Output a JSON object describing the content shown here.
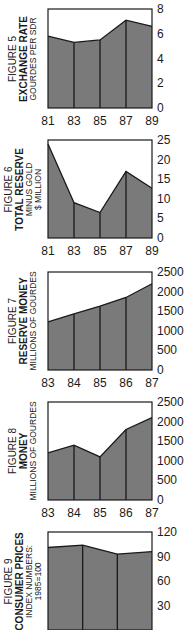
{
  "chart_data": [
    {
      "type": "area",
      "figure": "FIGURE 5",
      "title": "EXCHANGE RATE",
      "ylabel": "GOURDES PER SDR",
      "categories": [
        "81",
        "83",
        "85",
        "87",
        "89"
      ],
      "values": [
        5.8,
        5.3,
        5.5,
        7.1,
        6.6
      ],
      "yticks": [
        0,
        2,
        4,
        6,
        8
      ],
      "ylim": [
        0,
        8
      ]
    },
    {
      "type": "area",
      "figure": "FIGURE 6",
      "title": "TOTAL RESERVE",
      "ylabel": "MINUS GOLD $ MILLION",
      "ylabel_lines": [
        "MINUS GOLD",
        "$ MILLION"
      ],
      "categories": [
        "81",
        "83",
        "85",
        "87",
        "89"
      ],
      "values": [
        24,
        9,
        6.5,
        17,
        12.7
      ],
      "yticks": [
        0,
        5,
        10,
        15,
        20,
        25
      ],
      "ylim": [
        0,
        25
      ]
    },
    {
      "type": "area",
      "figure": "FIGURE 7",
      "title": "RESERVE MONEY",
      "ylabel": "MILLIONS OF GOURDES",
      "categories": [
        "83",
        "84",
        "85",
        "86",
        "87"
      ],
      "values": [
        1230,
        1430,
        1630,
        1850,
        2200
      ],
      "yticks": [
        0,
        500,
        1000,
        1500,
        2000,
        2500
      ],
      "ylim": [
        0,
        2500
      ]
    },
    {
      "type": "area",
      "figure": "FIGURE 8",
      "title": "MONEY",
      "ylabel": "MILLIONS OF GOURDES",
      "categories": [
        "83",
        "84",
        "85",
        "86",
        "87"
      ],
      "values": [
        1200,
        1400,
        1100,
        1800,
        2100
      ],
      "yticks": [
        0,
        500,
        1000,
        1500,
        2000,
        2500
      ],
      "ylim": [
        0,
        2500
      ]
    },
    {
      "type": "area",
      "figure": "FIGURE 9",
      "title": "CONSUMER PRICES",
      "ylabel": "INDEX NUMBERS: 1985=100",
      "ylabel_lines": [
        "INDEX NUMBERS:",
        "1985=100"
      ],
      "categories": [
        "",
        "",
        "",
        ""
      ],
      "values": [
        101,
        104,
        93,
        96
      ],
      "yticks": [
        30,
        60,
        90,
        120
      ],
      "ylim": [
        0,
        120
      ]
    }
  ],
  "style": {
    "fill": "#7a7a7a",
    "line": "#1a1a1a",
    "frame": "#1a1a1a"
  }
}
